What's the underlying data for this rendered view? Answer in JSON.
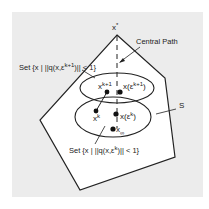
{
  "diagram": {
    "labels": {
      "x_star": "x",
      "x_star_sup": "*",
      "central_path": "Central Path",
      "set_upper_prefix": "Set {x | ||q(x,ε",
      "set_upper_sup": "k+1",
      "set_upper_suffix": ")|| < 1}",
      "x_k1": "x",
      "x_k1_sup": "k+1",
      "x_eps_k1_prefix": "x(ε",
      "x_eps_k1_sup": "k+1",
      "x_eps_k1_suffix": ")",
      "S": "S",
      "x_k": "x",
      "x_k_sup": "k",
      "x_eps_k_prefix": "x(ε",
      "x_eps_k_sup": "k",
      "x_eps_k_suffix": ")",
      "x_inf": "x",
      "x_inf_sub": "∞",
      "set_lower_prefix": "Set {x | ||q(x,ε",
      "set_lower_sup": "k",
      "set_lower_suffix": ")|| < 1}"
    },
    "colors": {
      "background": "#ececec",
      "polygon_fill": "#ffffff",
      "stroke": "#222222"
    }
  }
}
